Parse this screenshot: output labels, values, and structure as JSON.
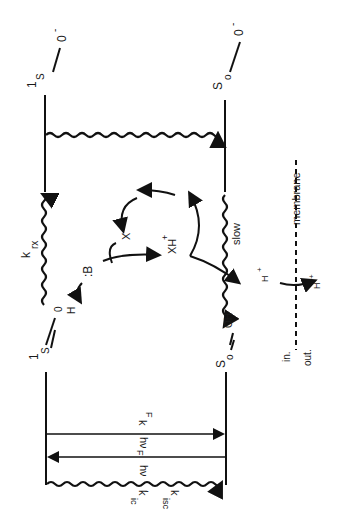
{
  "diagram": {
    "orientation": "rotated 90 degrees clockwise",
    "states": {
      "acid_excited": {
        "label": "1",
        "sub": "S",
        "group": "0",
        "charge": "-"
      },
      "base_excited_top": {
        "label": "1",
        "sub": "S",
        "group": "0",
        "charge": "-"
      },
      "ground_right": {
        "label": "S",
        "sub": "o",
        "group": "0",
        "charge": "-"
      },
      "excited_left": {
        "label": "1",
        "sub": "S",
        "group": "0",
        "extra": "H"
      },
      "ground_left": {
        "label": "S",
        "sub": "o",
        "group": "OH"
      }
    },
    "labels": {
      "k_rx": "k",
      "k_rx_sub": "rx",
      "base": ":B",
      "h": "H",
      "x": "X",
      "xh_plus": "XH",
      "plus": "+",
      "slow": "slow",
      "membrane": "membrane",
      "h_plus_in": "H",
      "h_plus_out": "H",
      "in": "in.",
      "out": "out.",
      "hv": "hν",
      "hv_f": "hν",
      "hv_f_sub": "F",
      "k_f": "k",
      "k_f_sub": "F",
      "k_ic": "k",
      "k_ic_sub": "ic",
      "k_isc": "k",
      "k_isc_sub": "isc",
      "comma": ","
    }
  }
}
